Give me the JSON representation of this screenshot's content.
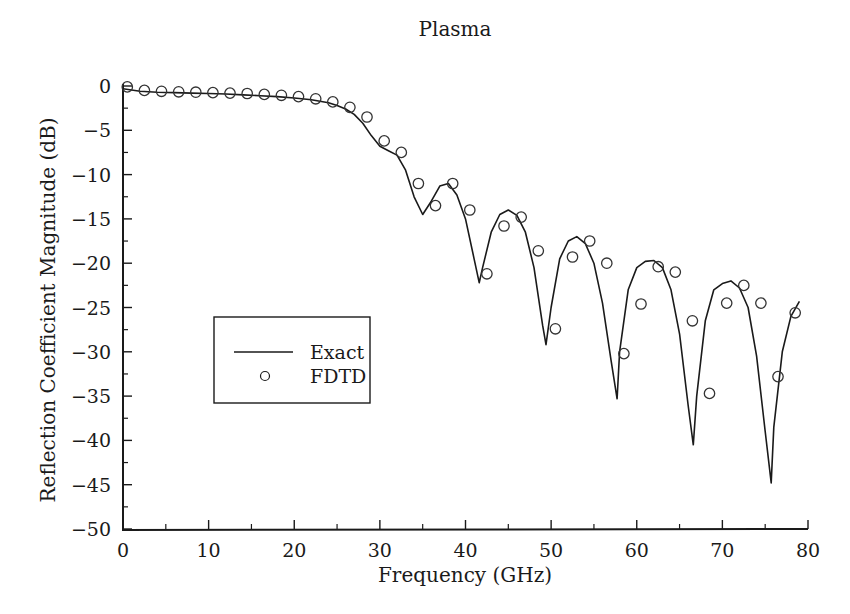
{
  "chart_data": {
    "type": "line",
    "title": "Plasma",
    "xlabel": "Frequency (GHz)",
    "ylabel": "Reflection Coefficient Magnitude (dB)",
    "xlim": [
      0,
      80
    ],
    "ylim": [
      -50,
      0
    ],
    "xticks": [
      0,
      10,
      20,
      30,
      40,
      50,
      60,
      70,
      80
    ],
    "yticks": [
      0,
      -5,
      -10,
      -15,
      -20,
      -25,
      -30,
      -35,
      -40,
      -45,
      -50
    ],
    "grid": false,
    "legend": {
      "position": "inside-left-middle",
      "entries": [
        "Exact",
        "FDTD"
      ]
    },
    "series": [
      {
        "name": "Exact",
        "style": "solid-line",
        "x": [
          0,
          2,
          4,
          6,
          8,
          10,
          12,
          14,
          16,
          18,
          20,
          22,
          24,
          25,
          26,
          27,
          28,
          29,
          30,
          31,
          32,
          33,
          34,
          35,
          36,
          37,
          38,
          39,
          40,
          41,
          41.6,
          42,
          43,
          44,
          45,
          46,
          47,
          48,
          49,
          49.4,
          50,
          51,
          52,
          53,
          54,
          55,
          56,
          57,
          57.7,
          58,
          59,
          60,
          61,
          62,
          63,
          64,
          65,
          66,
          66.6,
          67,
          68,
          69,
          70,
          71,
          72,
          73,
          74,
          75,
          75.7,
          76,
          77,
          78,
          79
        ],
        "y": [
          -0.3,
          -0.6,
          -0.7,
          -0.75,
          -0.8,
          -0.85,
          -0.9,
          -1.0,
          -1.1,
          -1.2,
          -1.35,
          -1.55,
          -1.9,
          -2.2,
          -2.6,
          -3.2,
          -4.2,
          -5.6,
          -6.8,
          -7.3,
          -7.8,
          -9.5,
          -12.5,
          -14.5,
          -13.0,
          -11.3,
          -11.0,
          -12.3,
          -15.0,
          -19.5,
          -22.2,
          -20.5,
          -16.5,
          -14.5,
          -14.0,
          -14.6,
          -16.5,
          -20.5,
          -27.0,
          -29.2,
          -25.0,
          -19.5,
          -17.5,
          -17.0,
          -17.8,
          -20.0,
          -24.5,
          -31.0,
          -35.3,
          -30.0,
          -23.0,
          -20.5,
          -19.8,
          -19.7,
          -20.5,
          -23.0,
          -28.0,
          -36.0,
          -40.5,
          -35.0,
          -26.5,
          -23.0,
          -22.3,
          -22.0,
          -22.8,
          -25.0,
          -30.5,
          -39.0,
          -44.8,
          -38.5,
          -30.0,
          -26.0,
          -24.3
        ]
      },
      {
        "name": "FDTD",
        "style": "open-circle-marker",
        "x": [
          0.5,
          2.5,
          4.5,
          6.5,
          8.5,
          10.5,
          12.5,
          14.5,
          16.5,
          18.5,
          20.5,
          22.5,
          24.5,
          26.5,
          28.5,
          30.5,
          32.5,
          34.5,
          36.5,
          38.5,
          40.5,
          42.5,
          44.5,
          46.5,
          48.5,
          50.5,
          52.5,
          54.5,
          56.5,
          58.5,
          60.5,
          62.5,
          64.5,
          66.5,
          68.5,
          70.5,
          72.5,
          74.5,
          76.5,
          78.5
        ],
        "y": [
          -0.1,
          -0.5,
          -0.6,
          -0.65,
          -0.7,
          -0.75,
          -0.8,
          -0.85,
          -0.95,
          -1.05,
          -1.2,
          -1.45,
          -1.8,
          -2.4,
          -3.5,
          -6.2,
          -7.5,
          -11.0,
          -13.5,
          -11.0,
          -14.0,
          -21.2,
          -15.8,
          -14.8,
          -18.6,
          -27.4,
          -19.3,
          -17.5,
          -20.0,
          -30.2,
          -24.6,
          -20.4,
          -21.0,
          -26.5,
          -34.7,
          -24.5,
          -22.5,
          -24.5,
          -32.8,
          -25.6
        ]
      }
    ]
  }
}
